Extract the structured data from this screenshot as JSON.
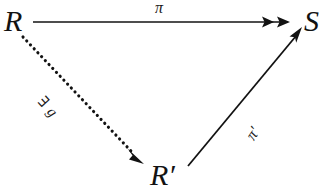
{
  "figure": {
    "kind": "commutative-diagram",
    "shape": "triangle",
    "background_color": "#ffffff",
    "ink_color": "#121212"
  },
  "nodes": [
    {
      "id": "R",
      "label": "R",
      "position": "top-left"
    },
    {
      "id": "S",
      "label": "S",
      "position": "top-right"
    },
    {
      "id": "Rp",
      "label": "R′",
      "position": "bottom-center"
    }
  ],
  "edges": [
    {
      "id": "pi",
      "label": "π",
      "from": "R",
      "to": "S",
      "style": "solid",
      "arrowhead": "double-head",
      "meaning": "surjection"
    },
    {
      "id": "exists_g",
      "label": "∃ g",
      "from": "R",
      "to": "Rp",
      "style": "dotted",
      "arrowhead": "single-head",
      "meaning": "existence"
    },
    {
      "id": "pi_prime",
      "label": "π′",
      "from": "Rp",
      "to": "S",
      "style": "solid",
      "arrowhead": "single-head",
      "meaning": "map"
    }
  ],
  "labels": {
    "node_R": "R",
    "node_S": "S",
    "node_R_prime": "R′",
    "edge_pi": "π",
    "edge_exists_g": "∃ g",
    "edge_pi_prime": "π′"
  }
}
